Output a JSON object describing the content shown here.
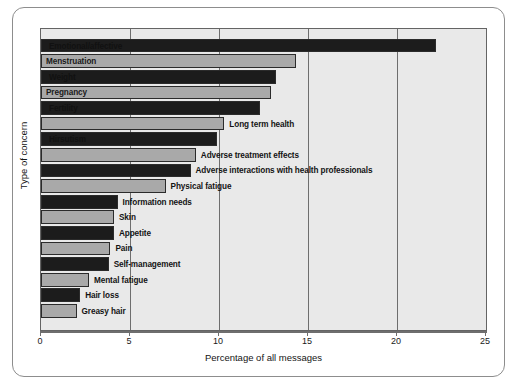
{
  "figure": {
    "ghost_text": [
      "different methodological",
      "effects of treatment that"
    ]
  },
  "chart_data": {
    "type": "bar",
    "orientation": "horizontal",
    "title": "",
    "xlabel": "Percentage of all messages",
    "ylabel": "Type of concern",
    "xlim": [
      0,
      25
    ],
    "ylim": null,
    "grid": true,
    "grid_axis": "x",
    "legend": null,
    "xticks": [
      0,
      5,
      10,
      15,
      20,
      25
    ],
    "xticklabels": [
      "0",
      "5",
      "10",
      "15",
      "20",
      "25"
    ],
    "colors": {
      "dark": "#1c1c1c",
      "light": "#a9a9a9",
      "plot_background": "#e9e9e9",
      "axis": "#6e6e6e"
    },
    "categories": [
      "Emotional/affective",
      "Menstruation",
      "Weight",
      "Pregnancy",
      "Fertility",
      "Long term health",
      "Hirsutism",
      "Adverse treatment effects",
      "Adverse interactions with health professionals",
      "Physical fatigue",
      "Information needs",
      "Skin",
      "Appetite",
      "Pain",
      "Self-management",
      "Mental fatigue",
      "Hair loss",
      "Greasy hair"
    ],
    "values": [
      22.2,
      14.3,
      13.2,
      12.9,
      12.3,
      10.3,
      9.9,
      8.7,
      8.4,
      7.0,
      4.3,
      4.1,
      4.1,
      3.9,
      3.8,
      2.7,
      2.2,
      2.0
    ],
    "bars": [
      {
        "label": "Emotional/affective",
        "value": 22.2,
        "shade": "dark",
        "label_position": "inside"
      },
      {
        "label": "Menstruation",
        "value": 14.3,
        "shade": "light",
        "label_position": "inside"
      },
      {
        "label": "Weight",
        "value": 13.2,
        "shade": "dark",
        "label_position": "inside"
      },
      {
        "label": "Pregnancy",
        "value": 12.9,
        "shade": "light",
        "label_position": "inside"
      },
      {
        "label": "Fertility",
        "value": 12.3,
        "shade": "dark",
        "label_position": "inside"
      },
      {
        "label": "Long term health",
        "value": 10.3,
        "shade": "light",
        "label_position": "outside"
      },
      {
        "label": "Hirsutism",
        "value": 9.9,
        "shade": "dark",
        "label_position": "inside"
      },
      {
        "label": "Adverse treatment effects",
        "value": 8.7,
        "shade": "light",
        "label_position": "outside"
      },
      {
        "label": "Adverse interactions with health professionals",
        "value": 8.4,
        "shade": "dark",
        "label_position": "outside"
      },
      {
        "label": "Physical fatigue",
        "value": 7.0,
        "shade": "light",
        "label_position": "outside"
      },
      {
        "label": "Information needs",
        "value": 4.3,
        "shade": "dark",
        "label_position": "outside"
      },
      {
        "label": "Skin",
        "value": 4.1,
        "shade": "light",
        "label_position": "outside"
      },
      {
        "label": "Appetite",
        "value": 4.1,
        "shade": "dark",
        "label_position": "outside"
      },
      {
        "label": "Pain",
        "value": 3.9,
        "shade": "light",
        "label_position": "outside"
      },
      {
        "label": "Self-management",
        "value": 3.8,
        "shade": "dark",
        "label_position": "outside"
      },
      {
        "label": "Mental fatigue",
        "value": 2.7,
        "shade": "light",
        "label_position": "outside"
      },
      {
        "label": "Hair loss",
        "value": 2.2,
        "shade": "dark",
        "label_position": "outside"
      },
      {
        "label": "Greasy hair",
        "value": 2.0,
        "shade": "light",
        "label_position": "outside"
      }
    ]
  }
}
